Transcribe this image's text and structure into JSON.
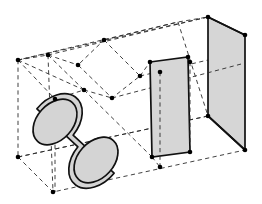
{
  "figure": {
    "title": "3D wireframe technical illustration",
    "background_color": "#ffffff",
    "line_colors": {
      "hidden_edge": "#2b2b2b",
      "solid_edge": "#111111",
      "face_fill": "#d6d6d6",
      "cylinder_fill": "#d4d4d4",
      "vertex_dot": "#000000"
    },
    "line_styles": {
      "hidden": "dashed",
      "visible": "solid"
    },
    "objects": [
      {
        "name": "bounding-box",
        "kind": "wireframe-box",
        "style": "dashed",
        "vertices": [
          [
            18,
            60
          ],
          [
            48,
            55
          ],
          [
            208,
            17
          ],
          [
            178,
            22
          ],
          [
            18,
            157
          ],
          [
            53,
            192
          ],
          [
            245,
            150
          ],
          [
            208,
            116
          ]
        ]
      },
      {
        "name": "cylinder",
        "kind": "solid-cylinder",
        "style": "shaded",
        "axis_start": [
          55,
          122
        ],
        "axis_end": [
          96,
          160
        ],
        "radius": 26
      },
      {
        "name": "rhombus-panel-outline",
        "kind": "planar-quad",
        "style": "dashed",
        "vertices": [
          [
            104,
            40
          ],
          [
            140,
            76
          ],
          [
            112,
            98
          ],
          [
            78,
            65
          ]
        ]
      },
      {
        "name": "front-plate",
        "kind": "rectangular-plate",
        "style": "shaded",
        "vertices": [
          [
            150,
            62
          ],
          [
            188,
            57
          ],
          [
            190,
            152
          ],
          [
            152,
            157
          ]
        ]
      },
      {
        "name": "back-plate",
        "kind": "rectangular-plate",
        "style": "shaded",
        "vertices": [
          [
            208,
            17
          ],
          [
            245,
            35
          ],
          [
            245,
            150
          ],
          [
            208,
            116
          ]
        ]
      }
    ],
    "vertex_markers": [
      [
        18,
        60
      ],
      [
        48,
        55
      ],
      [
        104,
        40
      ],
      [
        78,
        65
      ],
      [
        140,
        76
      ],
      [
        112,
        98
      ],
      [
        84,
        90
      ],
      [
        55,
        99
      ],
      [
        18,
        157
      ],
      [
        53,
        192
      ],
      [
        208,
        17
      ],
      [
        245,
        35
      ],
      [
        150,
        62
      ],
      [
        188,
        57
      ],
      [
        152,
        157
      ],
      [
        190,
        152
      ],
      [
        160,
        72
      ],
      [
        160,
        167
      ],
      [
        208,
        116
      ],
      [
        245,
        150
      ],
      [
        190,
        62
      ]
    ]
  }
}
